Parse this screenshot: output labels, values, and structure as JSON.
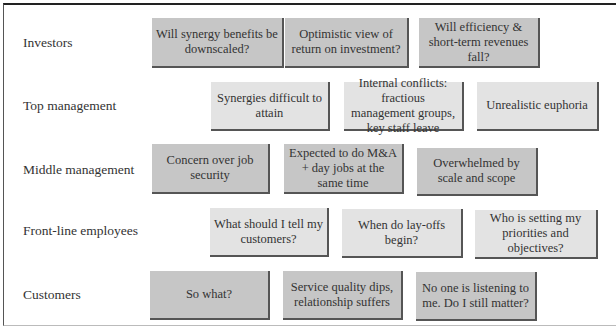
{
  "diagram": {
    "rows": [
      {
        "label": "Investors",
        "boxes": [
          {
            "text": "Will synergy benefits be downscaled?",
            "shade": "dark"
          },
          {
            "text": "Optimistic view of return on investment?",
            "shade": "dark"
          },
          {
            "text": "Will efficiency & short-term revenues fall?",
            "shade": "dark"
          }
        ]
      },
      {
        "label": "Top management",
        "boxes": [
          {
            "text": "Synergies difficult to attain",
            "shade": "light"
          },
          {
            "text": "Internal conflicts: fractious management groups, key staff leave",
            "shade": "light"
          },
          {
            "text": "Unrealistic euphoria",
            "shade": "light"
          }
        ]
      },
      {
        "label": "Middle management",
        "boxes": [
          {
            "text": "Concern over job security",
            "shade": "dark"
          },
          {
            "text": "Expected to do M&A + day jobs at the same time",
            "shade": "dark"
          },
          {
            "text": "Overwhelmed by scale and scope",
            "shade": "dark"
          }
        ]
      },
      {
        "label": "Front-line employees",
        "boxes": [
          {
            "text": "What should I tell my customers?",
            "shade": "light"
          },
          {
            "text": "When do lay-offs begin?",
            "shade": "light"
          },
          {
            "text": "Who is setting my priorities and objectives?",
            "shade": "light"
          }
        ]
      },
      {
        "label": "Customers",
        "boxes": [
          {
            "text": "So what?",
            "shade": "dark"
          },
          {
            "text": "Service quality dips, relationship suffers",
            "shade": "dark"
          },
          {
            "text": "No one is listening to me. Do I still matter?",
            "shade": "dark"
          }
        ]
      }
    ],
    "colors": {
      "dark_box": "#c6c6c6",
      "light_box": "#e3e3e3",
      "shadow": "#555555"
    }
  }
}
